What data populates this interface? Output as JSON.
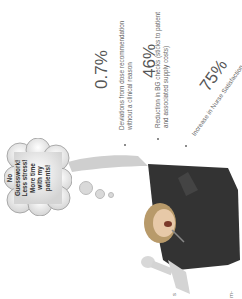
{
  "slide": {
    "orientation": "rotated-90-ccw",
    "stats": [
      {
        "value": "0.7%",
        "description_line1": "Deviations from dose recommendation",
        "description_line2": "without a clinical reason"
      },
      {
        "value": "46%",
        "description_line1": "Reduction in BG checks (sticks to patient",
        "description_line2": "and associated supply costs)"
      },
      {
        "value": "75%",
        "description_line1": "Increase in Nurse Satisfaction",
        "description_line2": ""
      }
    ],
    "thought_bubble": {
      "lines": [
        "No",
        "Guesswork!",
        "Less stress!",
        "More time",
        "with my",
        "patients!"
      ]
    },
    "footer_marks": [
      "s",
      "m-"
    ]
  }
}
